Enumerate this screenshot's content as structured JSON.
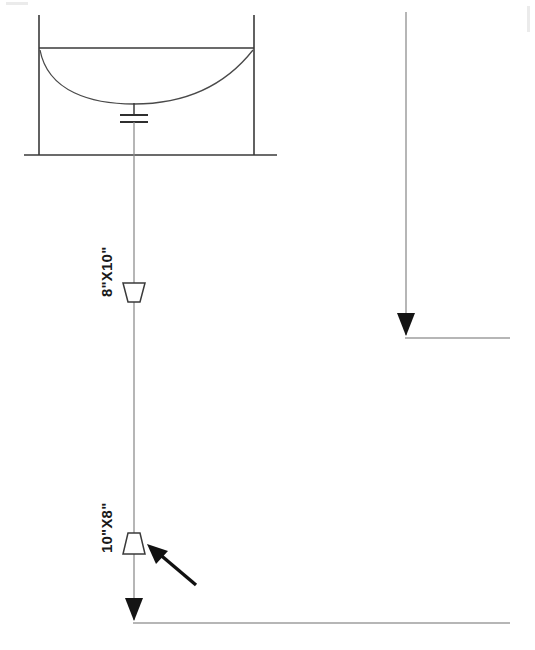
{
  "drawing": {
    "title": "Vessel Drain Piping Detail",
    "background_color": "#ffffff",
    "line_color": "#3a3a3a",
    "annotation_color": "#111111",
    "labels": {
      "upper_reducer": "8\"X10\"",
      "lower_reducer": "10\"X8\""
    }
  },
  "vessel": {
    "name": "dished-bottom-vessel",
    "left_wall_x": 39,
    "right_wall_x": 254,
    "wall_top_y": 15,
    "rim_y": 48,
    "base_y": 155,
    "base_left_x": 24,
    "base_right_x": 277,
    "dish_center_y": 103
  },
  "fitting": {
    "name": "flange-coupling",
    "bar1_y": 115,
    "bar2_y": 122,
    "bar_half_width": 14,
    "stem_top_y": 103
  },
  "main_pipe": {
    "x": 134,
    "top_y": 103,
    "bottom_y": 620,
    "outlet_y": 623,
    "outlet_end_x": 510
  },
  "right_pipe": {
    "x": 406,
    "top_y": 12,
    "bottom_y": 335,
    "outlet_y": 338,
    "outlet_end_x": 510
  },
  "reducers": [
    {
      "name": "upper-reducer",
      "label": "8\"X10\"",
      "center_x": 134,
      "top_y": 283,
      "bottom_y": 302,
      "top_half_width": 11,
      "bottom_half_width": 6,
      "orientation": "wide-top",
      "label_x": 112,
      "label_y": 297
    },
    {
      "name": "lower-reducer",
      "label": "10\"X8\"",
      "center_x": 134,
      "top_y": 533,
      "bottom_y": 554,
      "top_half_width": 6,
      "bottom_half_width": 11,
      "orientation": "narrow-top",
      "label_x": 112,
      "label_y": 553
    }
  ],
  "arrowheads": [
    {
      "name": "main-pipe-arrowhead",
      "x": 134,
      "tip_y": 620,
      "width": 18,
      "height": 22
    },
    {
      "name": "right-pipe-arrowhead",
      "x": 406,
      "tip_y": 335,
      "width": 18,
      "height": 22
    }
  ],
  "callout_arrow": {
    "name": "reducer-callout-arrow",
    "tail_x": 196,
    "tail_y": 585,
    "tip_x": 148,
    "tip_y": 545,
    "color": "#111111"
  }
}
